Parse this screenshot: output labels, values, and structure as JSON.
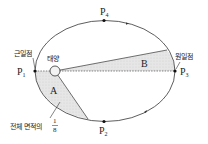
{
  "diagram": {
    "points": {
      "p1": {
        "label": "P",
        "sub": "1"
      },
      "p2": {
        "label": "P",
        "sub": "2"
      },
      "p3": {
        "label": "P",
        "sub": "3"
      },
      "p4": {
        "label": "P",
        "sub": "4"
      }
    },
    "labels": {
      "perihelion": "근일점",
      "aphelion": "원일점",
      "sun": "태양",
      "area_a": "A",
      "area_b": "B",
      "area_note": "전체 면적의",
      "fraction_num": "1",
      "fraction_den": "8"
    },
    "colors": {
      "line": "#333333",
      "shade": "#e4e4e4",
      "background": "#ffffff"
    }
  }
}
